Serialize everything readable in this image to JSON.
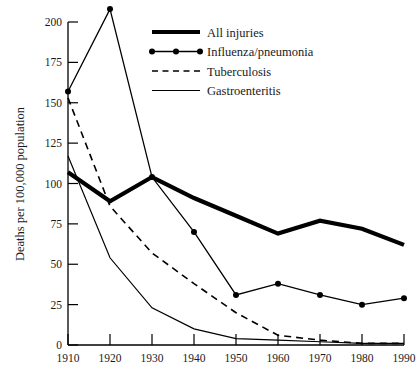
{
  "chart_data": {
    "type": "line",
    "title": "",
    "xlabel": "",
    "ylabel": "Deaths per 100,000 population",
    "x": [
      1910,
      1920,
      1930,
      1940,
      1950,
      1960,
      1970,
      1980,
      1990
    ],
    "xtick_labels": [
      "1910",
      "1920",
      "1930",
      "1940",
      "1950",
      "1960",
      "1970",
      "1980",
      "1990"
    ],
    "ytick_labels": [
      "0",
      "25",
      "50",
      "75",
      "100",
      "125",
      "150",
      "175",
      "200"
    ],
    "yticks": [
      0,
      25,
      50,
      75,
      100,
      125,
      150,
      175,
      200
    ],
    "xlim": [
      1910,
      1990
    ],
    "ylim": [
      0,
      200
    ],
    "grid": false,
    "legend_position": "top-right",
    "series": [
      {
        "name": "All injuries",
        "style": "thick-solid",
        "color": "#000000",
        "marker": "none",
        "values": [
          107,
          89,
          104,
          91,
          80,
          69,
          77,
          72,
          62
        ]
      },
      {
        "name": "Influenza/pneumonia",
        "style": "solid-markers",
        "color": "#000000",
        "marker": "circle",
        "values": [
          157,
          208,
          104,
          70,
          31,
          38,
          31,
          25,
          29
        ]
      },
      {
        "name": "Tuberculosis",
        "style": "dashed",
        "color": "#000000",
        "marker": "none",
        "values": [
          153,
          86,
          57,
          38,
          20,
          6,
          3,
          1,
          1
        ]
      },
      {
        "name": "Gastroenteritis",
        "style": "thin-solid",
        "color": "#000000",
        "marker": "none",
        "values": [
          117,
          54,
          23,
          10,
          4,
          3,
          2,
          1,
          1
        ]
      }
    ]
  },
  "legend": {
    "entries": [
      {
        "label": "All injuries",
        "swatch": "thick-solid"
      },
      {
        "label": "Influenza/pneumonia",
        "swatch": "solid-markers"
      },
      {
        "label": "Tuberculosis",
        "swatch": "dashed"
      },
      {
        "label": "Gastroenteritis",
        "swatch": "thin-solid"
      }
    ]
  },
  "colors": {
    "ink": "#000000",
    "background": "#ffffff"
  }
}
